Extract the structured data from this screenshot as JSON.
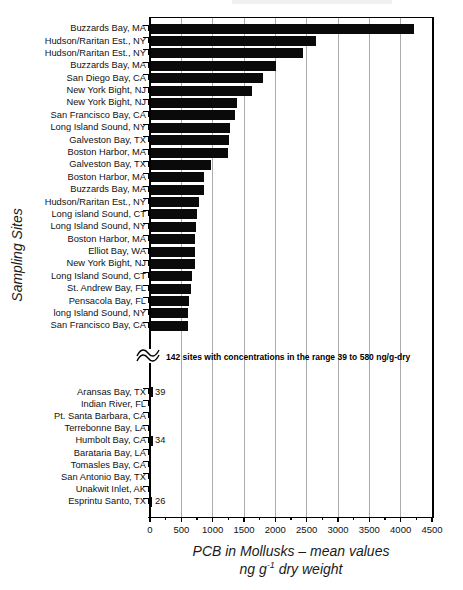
{
  "figure": {
    "y_axis_title": "Sampling Sites",
    "x_axis_title_line1": "PCB in Mollusks – mean values",
    "x_axis_title_ng": "ng g",
    "x_axis_title_sup": "-1",
    "x_axis_title_rest": " dry weight",
    "break_annotation": "142 sites with concentrations in the range 39 to 580 ng/g-dry"
  },
  "chart_data": {
    "type": "bar",
    "orientation": "horizontal",
    "title": "",
    "xlabel": "PCB in Mollusks – mean values ng g-1 dry weight",
    "ylabel": "Sampling Sites",
    "xlim": [
      0,
      4500
    ],
    "x_ticks": [
      0,
      500,
      1000,
      1500,
      2000,
      2500,
      3000,
      3500,
      4000,
      4500
    ],
    "minor_tick_step": 250,
    "grid": "vertical-major",
    "bar_color": "#0a0a0a",
    "axis_break_note": "142 sites with concentrations in the range 39 to 580 ng/g-dry",
    "top_section": [
      {
        "label": "Buzzards Bay, MA",
        "value": 4200
      },
      {
        "label": "Hudson/Raritan Est., NY",
        "value": 2640
      },
      {
        "label": "Hudson/Raritan Est., NY",
        "value": 2430
      },
      {
        "label": "Buzzards Bay, MA",
        "value": 2000
      },
      {
        "label": "San Diego Bay, CA",
        "value": 1790
      },
      {
        "label": "New York Bight, NJ",
        "value": 1610
      },
      {
        "label": "New York Bight, NJ",
        "value": 1380
      },
      {
        "label": "San Francisco Bay, CA",
        "value": 1340
      },
      {
        "label": "Long Island Sound, NY",
        "value": 1270
      },
      {
        "label": "Galveston Bay, TX",
        "value": 1245
      },
      {
        "label": "Boston Harbor, MA",
        "value": 1240
      },
      {
        "label": "Galveston Bay, TX",
        "value": 970
      },
      {
        "label": "Boston Harbor, MA",
        "value": 845
      },
      {
        "label": "Buzzards Bay, MA",
        "value": 850
      },
      {
        "label": "Hudson/Raritan Est., NY",
        "value": 770
      },
      {
        "label": "Long island Sound, CT",
        "value": 745
      },
      {
        "label": "Long Island Sound, NY",
        "value": 725
      },
      {
        "label": "Boston Harbor, MA",
        "value": 715
      },
      {
        "label": "Elliot Bay, WA",
        "value": 710
      },
      {
        "label": "New York Bight, NJ",
        "value": 705
      },
      {
        "label": "Long Island Sound, CT",
        "value": 665
      },
      {
        "label": "St. Andrew Bay, FL",
        "value": 650
      },
      {
        "label": "Pensacola Bay, FL",
        "value": 615
      },
      {
        "label": "long Island Sound, NY",
        "value": 600
      },
      {
        "label": "San Francisco Bay, CA",
        "value": 590
      }
    ],
    "bottom_section": [
      {
        "label": "Aransas Bay, TX",
        "value": 39,
        "annotation": "39"
      },
      {
        "label": "Indian River, FL",
        "value": null,
        "annotation": ""
      },
      {
        "label": "Pt. Santa Barbara, CA",
        "value": null,
        "annotation": ""
      },
      {
        "label": "Terrebonne Bay, LA",
        "value": null,
        "annotation": ""
      },
      {
        "label": "Humbolt Bay, CA",
        "value": 34,
        "annotation": "34"
      },
      {
        "label": "Barataria Bay, LA",
        "value": null,
        "annotation": ""
      },
      {
        "label": "Tomasles Bay, CA",
        "value": null,
        "annotation": ""
      },
      {
        "label": "San Antonio Bay, TX",
        "value": null,
        "annotation": ""
      },
      {
        "label": "Unakwit Inlet, AK",
        "value": null,
        "annotation": ""
      },
      {
        "label": "Esprintu Santo, TX",
        "value": 26,
        "annotation": "26"
      }
    ]
  }
}
